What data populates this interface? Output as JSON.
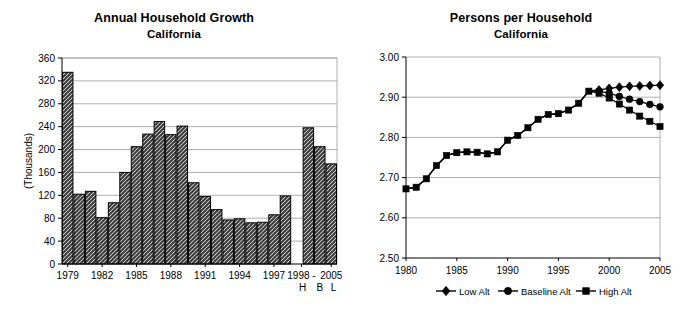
{
  "charts": {
    "left": {
      "title": "Annual Household Growth",
      "subtitle": "California",
      "ylabel": "(Thousands)"
    },
    "right": {
      "title": "Persons per Household",
      "subtitle": "California"
    }
  },
  "chart_data": [
    {
      "id": "annual-household-growth",
      "type": "bar",
      "title": "Annual Household Growth",
      "subtitle": "California",
      "xlabel": "",
      "ylabel": "(Thousands)",
      "ylim": [
        0,
        360
      ],
      "yticks": [
        0,
        40,
        80,
        120,
        160,
        200,
        240,
        280,
        320,
        360
      ],
      "ytick_labels": [
        "0",
        "40",
        "80",
        "120",
        "160",
        "200",
        "240",
        "280",
        "320",
        "360"
      ],
      "grid": true,
      "legend": "none",
      "xtick_labels": [
        "1979",
        "1982",
        "1985",
        "1988",
        "1991",
        "1994",
        "1997",
        "1998 -",
        "2005"
      ],
      "xtick_sublabels": [
        "",
        "",
        "",
        "",
        "",
        "",
        "",
        "H",
        "B  L"
      ],
      "categories": [
        "1979",
        "1980",
        "1981",
        "1982",
        "1983",
        "1984",
        "1985",
        "1986",
        "1987",
        "1988",
        "1989",
        "1990",
        "1991",
        "1992",
        "1993",
        "1994",
        "1995",
        "1996",
        "1997",
        "1998",
        "",
        "H",
        "B",
        "L"
      ],
      "values": [
        335,
        122,
        127,
        81,
        107,
        160,
        205,
        227,
        249,
        226,
        241,
        142,
        118,
        95,
        77,
        79,
        72,
        73,
        86,
        119,
        null,
        238,
        205,
        175
      ],
      "series_note": "Last three bars are 1998-2005 projections: High (H), Baseline (B), Low (L) alternatives"
    },
    {
      "id": "persons-per-household",
      "type": "line",
      "title": "Persons per Household",
      "subtitle": "California",
      "xlabel": "",
      "ylabel": "",
      "ylim": [
        2.5,
        3.0
      ],
      "yticks": [
        2.5,
        2.6,
        2.7,
        2.8,
        2.9,
        3.0
      ],
      "ytick_labels": [
        "2.50",
        "2.60",
        "2.70",
        "2.80",
        "2.90",
        "3.00"
      ],
      "xlim": [
        1980,
        2005
      ],
      "xticks": [
        1980,
        1985,
        1990,
        1995,
        2000,
        2005
      ],
      "xtick_labels": [
        "1980",
        "1985",
        "1990",
        "1995",
        "2000",
        "2005"
      ],
      "grid": true,
      "legend_position": "bottom",
      "x": [
        1980,
        1981,
        1982,
        1983,
        1984,
        1985,
        1986,
        1987,
        1988,
        1989,
        1990,
        1991,
        1992,
        1993,
        1994,
        1995,
        1996,
        1997,
        1998,
        1999,
        2000,
        2001,
        2002,
        2003,
        2004,
        2005
      ],
      "series": [
        {
          "name": "Low Alt",
          "marker": "diamond",
          "values": [
            2.672,
            2.676,
            2.697,
            2.73,
            2.755,
            2.762,
            2.764,
            2.763,
            2.759,
            2.764,
            2.793,
            2.805,
            2.824,
            2.845,
            2.857,
            2.859,
            2.868,
            2.885,
            2.915,
            2.918,
            2.922,
            2.925,
            2.927,
            2.928,
            2.929,
            2.93
          ]
        },
        {
          "name": "Baseline Alt",
          "marker": "circle",
          "values": [
            2.672,
            2.676,
            2.697,
            2.73,
            2.755,
            2.762,
            2.764,
            2.763,
            2.759,
            2.764,
            2.793,
            2.805,
            2.824,
            2.845,
            2.857,
            2.859,
            2.868,
            2.885,
            2.915,
            2.915,
            2.91,
            2.902,
            2.895,
            2.889,
            2.882,
            2.876
          ]
        },
        {
          "name": "High Alt",
          "marker": "square",
          "values": [
            2.672,
            2.676,
            2.697,
            2.73,
            2.755,
            2.762,
            2.764,
            2.763,
            2.759,
            2.764,
            2.793,
            2.805,
            2.824,
            2.845,
            2.857,
            2.859,
            2.868,
            2.885,
            2.915,
            2.91,
            2.898,
            2.883,
            2.868,
            2.853,
            2.84,
            2.827
          ]
        }
      ]
    }
  ]
}
